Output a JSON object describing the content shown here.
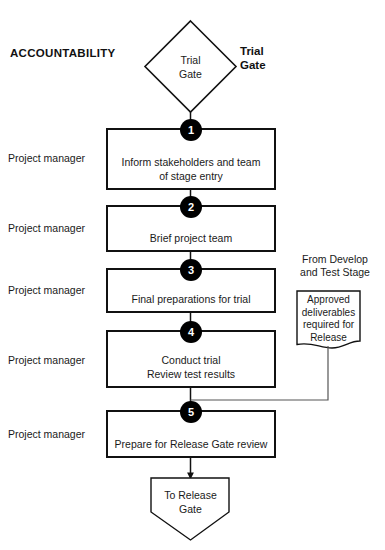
{
  "diagram": {
    "type": "flowchart",
    "header_left": "ACCOUNTABILITY",
    "header_right": "Trial Gate",
    "start_gate": {
      "shape": "diamond",
      "line1": "Trial",
      "line2": "Gate"
    },
    "end_terminator": {
      "shape": "pentagon-down",
      "line1": "To Release",
      "line2": "Gate"
    },
    "input_note": {
      "caption_line1": "From Develop",
      "caption_line2": "and Test Stage",
      "shape": "document",
      "line1": "Approved",
      "line2": "deliverables",
      "line3": "required for",
      "line4": "Release"
    },
    "steps": [
      {
        "number": "1",
        "role": "Project manager",
        "line1": "Inform stakeholders and team",
        "line2": "of stage entry"
      },
      {
        "number": "2",
        "role": "Project manager",
        "line1": "Brief project team",
        "line2": ""
      },
      {
        "number": "3",
        "role": "Project manager",
        "line1": "Final preparations for trial",
        "line2": ""
      },
      {
        "number": "4",
        "role": "Project manager",
        "line1": "Conduct trial",
        "line2": "Review test results"
      },
      {
        "number": "5",
        "role": "Project manager",
        "line1": "Prepare for Release Gate review",
        "line2": ""
      }
    ],
    "colors": {
      "stroke": "#111111",
      "badge_fill": "#000000",
      "badge_text": "#ffffff",
      "connector": "#555555",
      "background": "#ffffff"
    }
  }
}
